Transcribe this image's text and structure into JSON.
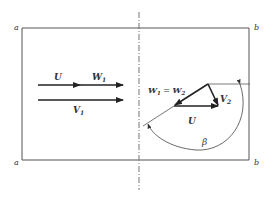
{
  "diagram": {
    "corner_labels": {
      "top_left": "a",
      "bottom_left": "a",
      "top_right": "b",
      "bottom_right": "b"
    },
    "inlet": {
      "u_label": "U",
      "w1_label": "W",
      "w1_sub": "1",
      "v1_label": "V",
      "v1_sub": "1"
    },
    "outlet": {
      "w_eq_label_a": "W",
      "w_eq_sub_a": "1",
      "w_eq_mid": " = ",
      "w_eq_label_b": "W",
      "w_eq_sub_b": "2",
      "v2_label": "V",
      "v2_sub": "2",
      "u_label": "U",
      "beta_label": "β"
    },
    "colors": {
      "line": "#333333",
      "frame": "#555555",
      "centerline": "#777777"
    }
  }
}
